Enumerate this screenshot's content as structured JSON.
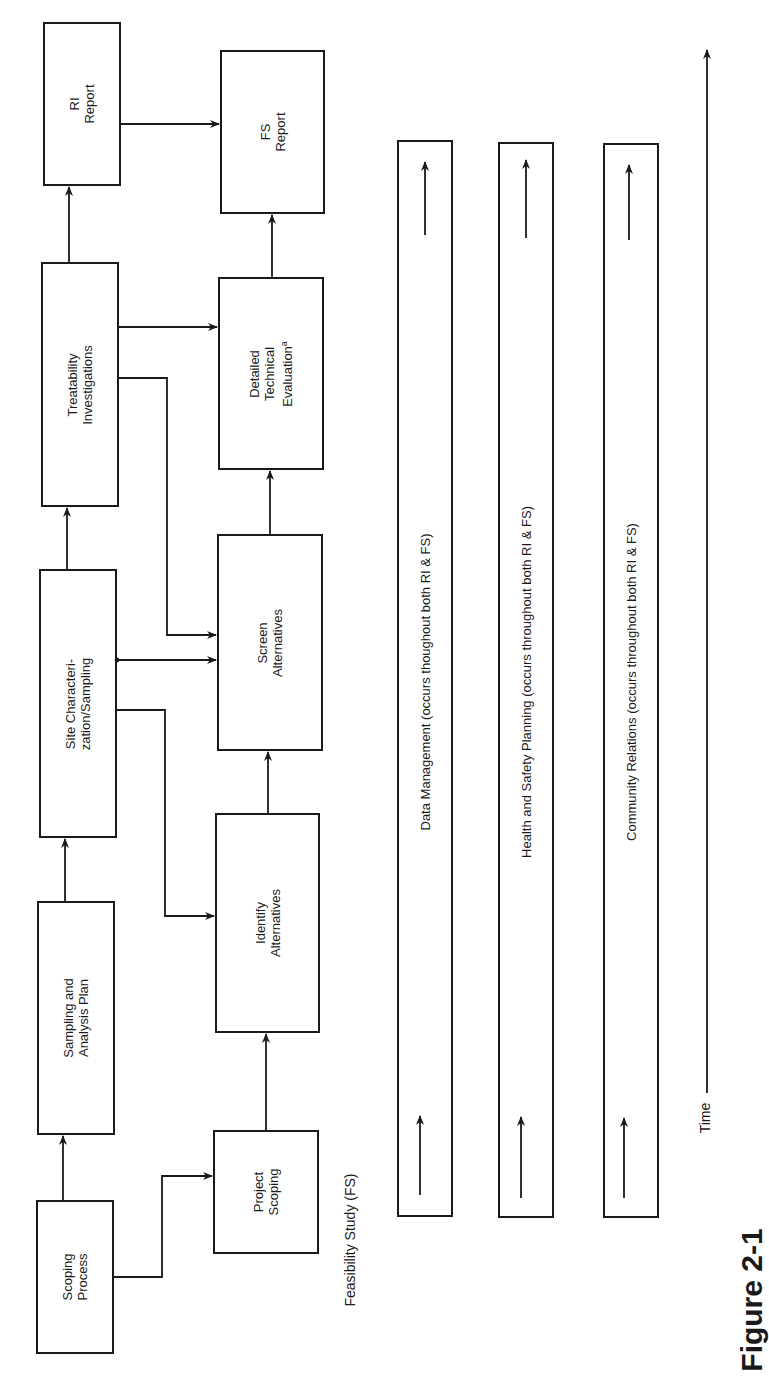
{
  "diagram": {
    "orientation": "rotated-90-ccw",
    "ri_row": [
      {
        "id": "scoping_process",
        "label": "Scoping\nProcess"
      },
      {
        "id": "sampling_plan",
        "label": "Sampling and\nAnalysis Plan"
      },
      {
        "id": "site_characterization",
        "label": "Site Characteri-\nzation/Sampling"
      },
      {
        "id": "treatability",
        "label": "Treatability\nInvestigations"
      },
      {
        "id": "ri_report",
        "label": "RI\nReport"
      }
    ],
    "fs_row": [
      {
        "id": "project_scoping",
        "label": "Project\nScoping"
      },
      {
        "id": "identify_alternatives",
        "label": "Identify\nAlternatives"
      },
      {
        "id": "screen_alternatives",
        "label": "Screen\nAlternatives"
      },
      {
        "id": "detailed_evaluation",
        "label": "Detailed\nTechnical\nEvaluation",
        "superscript": "a"
      },
      {
        "id": "fs_report",
        "label": "FS\nReport"
      }
    ],
    "fs_section_label": "Feasibility Study (FS)",
    "ongoing_bars": [
      {
        "label": "Data Management (occurs thoughout both RI & FS)"
      },
      {
        "label": "Health and Safety Planning (occurs throughout both RI & FS)"
      },
      {
        "label": "Community Relations (occurs throughout both RI & FS)"
      }
    ],
    "time_axis_label": "Time",
    "caption_fragment": "Figure 2-1",
    "edges": [
      {
        "from": "scoping_process",
        "to": "sampling_plan"
      },
      {
        "from": "scoping_process",
        "to": "project_scoping"
      },
      {
        "from": "sampling_plan",
        "to": "site_characterization"
      },
      {
        "from": "site_characterization",
        "to": "treatability"
      },
      {
        "from": "site_characterization",
        "to": "identify_alternatives"
      },
      {
        "from": "site_characterization",
        "to": "screen_alternatives"
      },
      {
        "from": "treatability",
        "to": "screen_alternatives"
      },
      {
        "from": "treatability",
        "to": "detailed_evaluation"
      },
      {
        "from": "treatability",
        "to": "ri_report"
      },
      {
        "from": "project_scoping",
        "to": "identify_alternatives"
      },
      {
        "from": "identify_alternatives",
        "to": "screen_alternatives"
      },
      {
        "from": "screen_alternatives",
        "to": "detailed_evaluation"
      },
      {
        "from": "detailed_evaluation",
        "to": "fs_report"
      },
      {
        "from": "ri_report",
        "to": "fs_report"
      }
    ]
  }
}
